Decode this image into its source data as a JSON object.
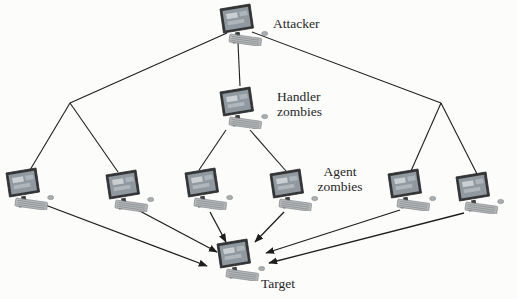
{
  "diagram": {
    "type": "network-hierarchy",
    "background_color": "#fcfcfb",
    "line_color": "#1e1e1e",
    "text_color": "#262626",
    "labels": {
      "attacker": "Attacker",
      "handler": [
        "Handler",
        "zombies"
      ],
      "agent": [
        "Agent",
        "zombies"
      ],
      "target": "Target"
    },
    "icon": "desktop-computer-icon",
    "icon_colors": {
      "monitor_frame": "#343638",
      "screen": "#9099a0",
      "screen_highlight": "#ccd2d5",
      "keyboard": "#b6b9bb",
      "base": "#4c4e50"
    },
    "nodes": [
      {
        "id": "attacker",
        "role": "attacker",
        "x": 216,
        "y": 2
      },
      {
        "id": "handler",
        "role": "handler-zombie",
        "x": 216,
        "y": 85
      },
      {
        "id": "agent-1",
        "role": "agent-zombie",
        "x": 2,
        "y": 166
      },
      {
        "id": "agent-2",
        "role": "agent-zombie",
        "x": 102,
        "y": 168
      },
      {
        "id": "agent-3",
        "role": "agent-zombie",
        "x": 181,
        "y": 166
      },
      {
        "id": "agent-4",
        "role": "agent-zombie",
        "x": 266,
        "y": 167
      },
      {
        "id": "agent-5",
        "role": "agent-zombie",
        "x": 384,
        "y": 167
      },
      {
        "id": "agent-6",
        "role": "agent-zombie",
        "x": 452,
        "y": 170
      },
      {
        "id": "target",
        "role": "target",
        "x": 213,
        "y": 237
      }
    ],
    "junctions": [
      {
        "id": "junction-left",
        "x": 70,
        "y": 103
      },
      {
        "id": "junction-right",
        "x": 441,
        "y": 103
      }
    ],
    "edges": [
      {
        "from": "attacker",
        "to": "junction-left",
        "x1": 227,
        "y1": 33,
        "x2": 70,
        "y2": 103,
        "arrow": false
      },
      {
        "from": "attacker",
        "to": "handler",
        "x1": 238,
        "y1": 43,
        "x2": 240,
        "y2": 86,
        "arrow": false
      },
      {
        "from": "attacker",
        "to": "junction-right",
        "x1": 252,
        "y1": 32,
        "x2": 441,
        "y2": 103,
        "arrow": false
      },
      {
        "from": "junction-left",
        "to": "agent-1",
        "x1": 70,
        "y1": 103,
        "x2": 30,
        "y2": 170,
        "arrow": false
      },
      {
        "from": "junction-left",
        "to": "agent-2",
        "x1": 70,
        "y1": 103,
        "x2": 118,
        "y2": 172,
        "arrow": false
      },
      {
        "from": "junction-right",
        "to": "agent-5",
        "x1": 441,
        "y1": 103,
        "x2": 411,
        "y2": 171,
        "arrow": false
      },
      {
        "from": "junction-right",
        "to": "agent-6",
        "x1": 441,
        "y1": 103,
        "x2": 477,
        "y2": 174,
        "arrow": false
      },
      {
        "from": "handler",
        "to": "agent-3",
        "x1": 226,
        "y1": 130,
        "x2": 199,
        "y2": 170,
        "arrow": false
      },
      {
        "from": "handler",
        "to": "agent-4",
        "x1": 250,
        "y1": 130,
        "x2": 286,
        "y2": 171,
        "arrow": false
      },
      {
        "from": "agent-1",
        "to": "target",
        "x1": 40,
        "y1": 203,
        "x2": 207,
        "y2": 266,
        "arrow": true
      },
      {
        "from": "agent-2",
        "to": "target",
        "x1": 136,
        "y1": 209,
        "x2": 217,
        "y2": 252,
        "arrow": true
      },
      {
        "from": "agent-3",
        "to": "target",
        "x1": 210,
        "y1": 212,
        "x2": 226,
        "y2": 242,
        "arrow": true
      },
      {
        "from": "agent-4",
        "to": "target",
        "x1": 284,
        "y1": 212,
        "x2": 255,
        "y2": 242,
        "arrow": true
      },
      {
        "from": "agent-5",
        "to": "target",
        "x1": 400,
        "y1": 210,
        "x2": 266,
        "y2": 253,
        "arrow": true
      },
      {
        "from": "agent-6",
        "to": "target",
        "x1": 464,
        "y1": 213,
        "x2": 269,
        "y2": 263,
        "arrow": true
      }
    ]
  }
}
